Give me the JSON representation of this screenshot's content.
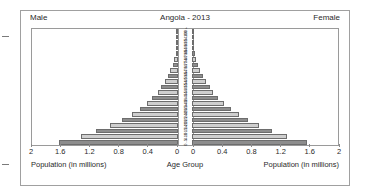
{
  "header": {
    "left_label": "Male",
    "title": "Angola - 2013",
    "right_label": "Female"
  },
  "axis": {
    "left_caption": "Population (in millions)",
    "center_caption": "Age Group",
    "right_caption": "Population (in millions)",
    "left_ticks": [
      "2",
      "1.6",
      "1.2",
      "0.8",
      "0.4",
      "0"
    ],
    "right_ticks": [
      "0",
      "0.4",
      "0.8",
      "1.2",
      "1.6",
      "2"
    ]
  },
  "colors": {
    "bar_dark": "#8d8d8d",
    "bar_light": "#cfcfcf",
    "bar_stroke": "#6d6d6d",
    "frame": "#9a9a9a",
    "card_border": "#a0a0a0",
    "background": "#ffffff",
    "text": "#1f1f1f"
  },
  "chart_data": {
    "type": "bar",
    "chart_subtype": "population-pyramid",
    "title": "Angola - 2013",
    "xlabel": "Population (in millions)",
    "ylabel": "Age Group",
    "xlim": [
      0,
      2
    ],
    "xticks": [
      0,
      0.4,
      0.8,
      1.2,
      1.6,
      2
    ],
    "grid": false,
    "legend": [
      "Male",
      "Female"
    ],
    "legend_position": "top-left and top-right",
    "orientation": "horizontal-mirrored",
    "categories": [
      "0 - 4",
      "5 - 9",
      "10 - 14",
      "15 - 19",
      "20 - 24",
      "25 - 29",
      "30 - 34",
      "35 - 39",
      "40 - 44",
      "45 - 49",
      "50 - 54",
      "55 - 59",
      "60 - 64",
      "65 - 69",
      "70 - 74",
      "75 - 79",
      "80 - 84",
      "85 - 89",
      "90 - 94",
      "95 - 99",
      "100 +"
    ],
    "series": [
      {
        "name": "Male",
        "side": "left",
        "values": [
          1.63,
          1.33,
          1.12,
          0.93,
          0.77,
          0.63,
          0.52,
          0.43,
          0.35,
          0.28,
          0.23,
          0.18,
          0.14,
          0.105,
          0.075,
          0.05,
          0.031,
          0.017,
          0.008,
          0.003,
          0.001
        ]
      },
      {
        "name": "Female",
        "side": "right",
        "values": [
          1.58,
          1.3,
          1.1,
          0.92,
          0.77,
          0.64,
          0.53,
          0.44,
          0.36,
          0.29,
          0.24,
          0.19,
          0.15,
          0.115,
          0.083,
          0.056,
          0.035,
          0.02,
          0.009,
          0.003,
          0.001
        ]
      }
    ]
  }
}
